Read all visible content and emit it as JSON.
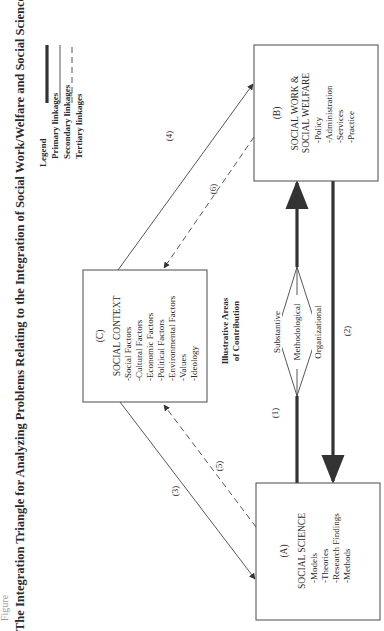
{
  "figure": {
    "label": "Figure",
    "title": "The Integration Triangle for Analyzing Problems Relating to the Integration of Social Work/Welfare and Social Science"
  },
  "legend": {
    "heading": "Legend",
    "items": [
      {
        "label": "Primary linkages",
        "style": "thick-solid"
      },
      {
        "label": "Secondary linkages",
        "style": "thin-solid"
      },
      {
        "label": "Tertiary linkages",
        "style": "dashed"
      }
    ]
  },
  "nodes": {
    "A": {
      "id": "(A)",
      "title": "SOCIAL SCIENCE",
      "items": [
        "-Models",
        "-Theories",
        "-Research Findings",
        "-Methods"
      ]
    },
    "B": {
      "id": "(B)",
      "title_line1": "SOCIAL WORK &",
      "title_line2": "SOCIAL WELFARE",
      "items": [
        "-Policy",
        "-Administration",
        "-Services",
        "-Practice"
      ]
    },
    "C": {
      "id": "(C)",
      "title": "SOCIAL CONTEXT",
      "items": [
        "-Social Factors",
        "-Cultural Factors",
        "-Economic Factors",
        "-Political Factors",
        "-Environmental Factors",
        "-Values",
        "-Ideology"
      ]
    }
  },
  "contribution": {
    "heading_line1": "Illustrative Areas",
    "heading_line2": "of Contribution",
    "areas": [
      "Substantive",
      "Methodological",
      "Organizational"
    ]
  },
  "edges": [
    {
      "label": "(1)",
      "from": "A",
      "to": "B",
      "type": "primary"
    },
    {
      "label": "(2)",
      "from": "B",
      "to": "A",
      "type": "primary"
    },
    {
      "label": "(3)",
      "from": "C",
      "to": "A",
      "type": "secondary"
    },
    {
      "label": "(4)",
      "from": "C",
      "to": "B",
      "type": "secondary"
    },
    {
      "label": "(5)",
      "from": "A",
      "to": "C",
      "type": "tertiary"
    },
    {
      "label": "(6)",
      "from": "B",
      "to": "C",
      "type": "tertiary"
    }
  ]
}
